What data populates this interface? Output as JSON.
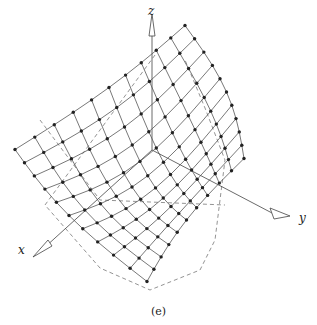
{
  "figure": {
    "caption": "(e)",
    "axes": {
      "x_label": "x",
      "y_label": "y",
      "z_label": "z"
    },
    "surface": {
      "type": "saddle-like wireframe surface with node markers",
      "grid_size": [
        11,
        11
      ],
      "corners": {
        "back": [
          185,
          33
        ],
        "left": [
          15,
          142
        ],
        "right": [
          244,
          151
        ],
        "front": [
          147,
          289
        ]
      },
      "line_color": "#555555",
      "node_color": "#222222"
    },
    "colors": {
      "axis": "#444444",
      "dashed": "#666666"
    }
  }
}
